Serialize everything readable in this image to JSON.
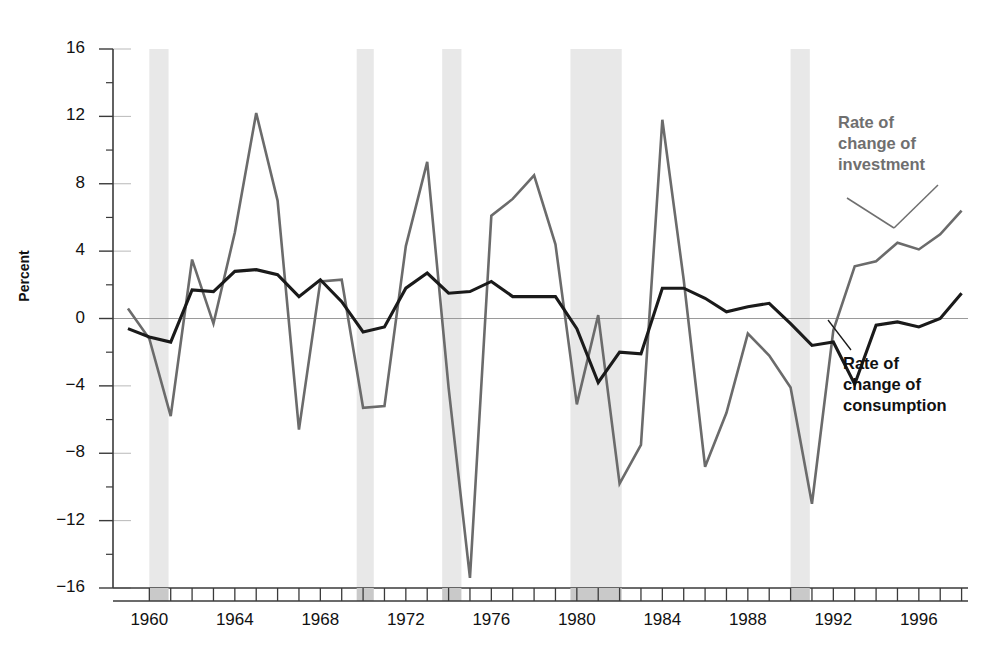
{
  "axes": {
    "ylabel": "Percent",
    "yticks": [
      16,
      12,
      8,
      4,
      0,
      -4,
      -8,
      -12,
      -16
    ],
    "ytick_labels": [
      "16",
      "12",
      "8",
      "4",
      "0",
      "−4",
      "−8",
      "−12",
      "−16"
    ],
    "xtick_labels": [
      "1960",
      "1964",
      "1968",
      "1972",
      "1976",
      "1980",
      "1984",
      "1988",
      "1992",
      "1996"
    ],
    "xtick_years": [
      1960,
      1964,
      1968,
      1972,
      1976,
      1980,
      1984,
      1988,
      1992,
      1996
    ],
    "xlim": [
      1958.3,
      1998.3
    ],
    "ylim": [
      -16,
      16
    ]
  },
  "annotations": {
    "investment": {
      "line1": "Rate of",
      "line2": "change of",
      "line3": "investment"
    },
    "consumption": {
      "line1": "Rate of",
      "line2": "change of",
      "line3": "consumption"
    }
  },
  "colors": {
    "investment_line": "#6b6b6b",
    "consumption_line": "#1a1a1a",
    "recession_band": "#e8e8e8",
    "axis": "#3a3a3a",
    "zero_line": "#9a9a9a",
    "background": "#ffffff"
  },
  "chart_data": {
    "type": "line",
    "title": "",
    "xlabel": "",
    "ylabel": "Percent",
    "xlim": [
      1958.3,
      1998.3
    ],
    "ylim": [
      -16,
      16
    ],
    "grid": false,
    "legend": "annotation-labels",
    "x": [
      1959,
      1960,
      1961,
      1962,
      1963,
      1964,
      1965,
      1966,
      1967,
      1968,
      1969,
      1970,
      1971,
      1972,
      1973,
      1974,
      1975,
      1976,
      1977,
      1978,
      1979,
      1980,
      1981,
      1982,
      1983,
      1984,
      1985,
      1986,
      1987,
      1988,
      1989,
      1990,
      1991,
      1992,
      1993,
      1994,
      1995,
      1996,
      1997,
      1998
    ],
    "series": [
      {
        "name": "Rate of change of investment",
        "color": "#6b6b6b",
        "values": [
          0.6,
          -1.2,
          -5.8,
          3.5,
          -0.3,
          5.1,
          12.2,
          7.0,
          -6.6,
          2.2,
          2.3,
          -5.3,
          -5.2,
          4.3,
          9.3,
          -4.1,
          -15.4,
          6.1,
          7.1,
          8.5,
          4.4,
          -5.1,
          0.2,
          -9.8,
          -7.5,
          11.8,
          2.3,
          -8.8,
          -5.6,
          -0.9,
          -2.2,
          -4.1,
          -11.0,
          -0.7,
          3.1,
          3.4,
          4.5,
          4.1,
          5.0,
          6.4
        ]
      },
      {
        "name": "Rate of change of consumption",
        "color": "#1a1a1a",
        "values": [
          -0.6,
          -1.1,
          -1.4,
          1.7,
          1.6,
          2.8,
          2.9,
          2.6,
          1.3,
          2.3,
          1.0,
          -0.8,
          -0.5,
          1.8,
          2.7,
          1.5,
          1.6,
          2.2,
          1.3,
          1.3,
          1.3,
          -0.6,
          -3.8,
          -2.0,
          -2.1,
          1.8,
          1.8,
          1.2,
          0.4,
          0.7,
          0.9,
          -0.3,
          -1.6,
          -1.4,
          -3.9,
          -0.4,
          -0.2,
          -0.5,
          0.0,
          1.5
        ]
      }
    ],
    "recession_bands": [
      {
        "start": 1960.0,
        "end": 1960.9
      },
      {
        "start": 1969.7,
        "end": 1970.5
      },
      {
        "start": 1973.7,
        "end": 1974.6
      },
      {
        "start": 1979.7,
        "end": 1982.1
      },
      {
        "start": 1990.0,
        "end": 1990.9
      }
    ]
  }
}
